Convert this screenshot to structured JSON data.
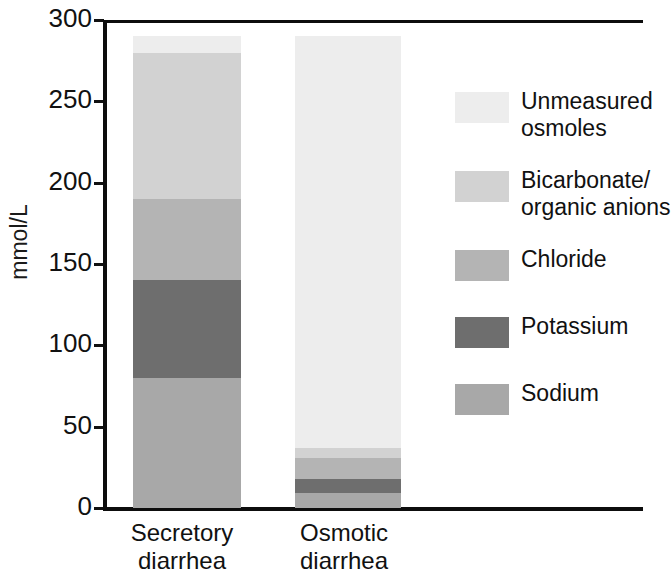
{
  "chart_data": {
    "type": "bar",
    "subtype": "stacked-bar",
    "title": "",
    "xlabel": "",
    "ylabel": "mmol/L",
    "ylim": [
      0,
      300
    ],
    "yticks": [
      0,
      50,
      100,
      150,
      200,
      250,
      300
    ],
    "ytick_labels": [
      "0",
      "50",
      "100",
      "150",
      "200",
      "250",
      "300"
    ],
    "grid": false,
    "legend_position": "right",
    "categories": [
      "Secretory diarrhea",
      "Osmotic diarrhea"
    ],
    "category_lines": [
      [
        "Secretory",
        "diarrhea"
      ],
      [
        "Osmotic",
        "diarrhea"
      ]
    ],
    "stack_order_bottom_to_top": [
      "Sodium",
      "Potassium",
      "Chloride",
      "Bicarbonate/organic anions",
      "Unmeasured osmoles"
    ],
    "series": [
      {
        "name": "Sodium",
        "values": [
          80,
          9
        ],
        "color": "#a8a8a8"
      },
      {
        "name": "Potassium",
        "values": [
          60,
          9
        ],
        "color": "#6e6e6e"
      },
      {
        "name": "Chloride",
        "values": [
          50,
          13
        ],
        "color": "#b4b4b4"
      },
      {
        "name": "Bicarbonate/organic anions",
        "values": [
          90,
          6
        ],
        "color": "#d2d2d2"
      },
      {
        "name": "Unmeasured osmoles",
        "values": [
          10,
          253
        ],
        "color": "#ededed"
      }
    ],
    "totals": [
      290,
      290
    ],
    "units": "mmol/L"
  },
  "axis": {
    "y_title": "mmol/L"
  },
  "legend": {
    "items": [
      {
        "label": "Unmeasured osmoles",
        "label_lines": [
          "Unmeasured",
          "osmoles"
        ],
        "color": "#ededed"
      },
      {
        "label": "Bicarbonate/organic anions",
        "label_lines": [
          "Bicarbonate/",
          "organic anions"
        ],
        "color": "#d2d2d2"
      },
      {
        "label": "Chloride",
        "label_lines": [
          "Chloride"
        ],
        "color": "#b4b4b4"
      },
      {
        "label": "Potassium",
        "label_lines": [
          "Potassium"
        ],
        "color": "#6e6e6e"
      },
      {
        "label": "Sodium",
        "label_lines": [
          "Sodium"
        ],
        "color": "#a8a8a8"
      }
    ]
  },
  "colors": {
    "axis": "#0d0d0d",
    "text": "#111111",
    "background": "#ffffff"
  }
}
